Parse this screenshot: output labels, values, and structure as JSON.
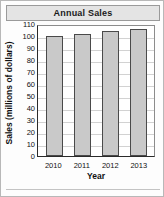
{
  "chart_data": {
    "type": "bar",
    "title": "Annual Sales",
    "xlabel": "Year",
    "ylabel": "Sales (millions of dollars)",
    "categories": [
      "2010",
      "2011",
      "2012",
      "2013"
    ],
    "values": [
      100,
      102,
      104,
      106
    ],
    "ylim": [
      0,
      110
    ],
    "ytick_values": [
      0,
      10,
      20,
      30,
      40,
      50,
      60,
      70,
      80,
      90,
      100,
      110
    ],
    "ytick_labels": [
      "0",
      "10",
      "20",
      "30",
      "40",
      "50",
      "60",
      "70",
      "80",
      "90",
      "100",
      "110"
    ],
    "grid": true,
    "legend": false,
    "series": [
      {
        "name": "Annual Sales",
        "values": [
          100,
          102,
          104,
          106
        ]
      }
    ],
    "colors": {
      "bar_fill": "#c9c9c9",
      "bar_border": "#4a4a4a",
      "axis": "#2a2a2a",
      "gridline": "#d2d2d2",
      "title_band": "#e4e4e4",
      "text": "#111111"
    }
  }
}
